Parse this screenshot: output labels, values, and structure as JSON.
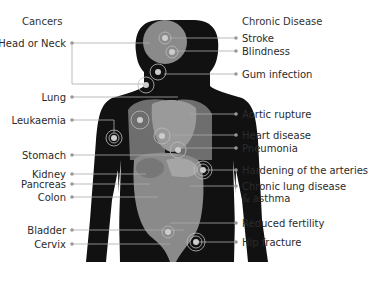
{
  "headings": {
    "cancers": "Cancers",
    "chronic": "Chronic Disease"
  },
  "cancers": [
    {
      "label": "Head or Neck",
      "y": 43
    },
    {
      "label": "Lung",
      "y": 97
    },
    {
      "label": "Leukaemia",
      "y": 120
    },
    {
      "label": "Stomach",
      "y": 155
    },
    {
      "label": "Kidney",
      "y": 174
    },
    {
      "label": "Pancreas",
      "y": 184
    },
    {
      "label": "Colon",
      "y": 197
    },
    {
      "label": "Bladder",
      "y": 230
    },
    {
      "label": "Cervix",
      "y": 244
    }
  ],
  "chronic": [
    {
      "label": "Stroke",
      "y": 38
    },
    {
      "label": "Blindness",
      "y": 51
    },
    {
      "label": "Gum infection",
      "y": 74
    },
    {
      "label": "Aortic rupture",
      "y": 114
    },
    {
      "label": "Heart disease",
      "y": 135
    },
    {
      "label": "Pneumonia",
      "y": 148
    },
    {
      "label": "Hardening of the arteries",
      "y": 170
    },
    {
      "label": "Chronic lung disease",
      "y": 186
    },
    {
      "label": "& asthma",
      "y": 198
    },
    {
      "label": "Reduced fertility",
      "y": 223
    },
    {
      "label": "Hip fracture",
      "y": 242
    }
  ],
  "colors": {
    "body": "#111111",
    "organs": "#8a8a8a",
    "line": "#999999",
    "text": "#2b2b2b"
  }
}
